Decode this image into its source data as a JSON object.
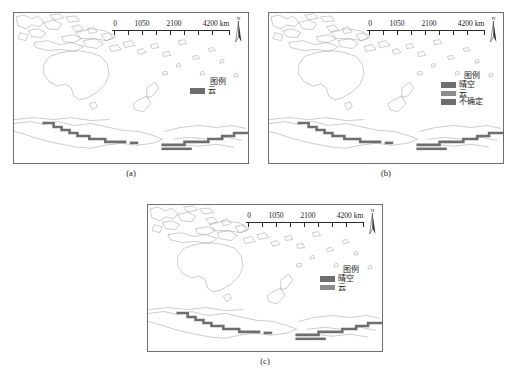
{
  "figure": {
    "background": "#ffffff",
    "panel_count": 3
  },
  "common": {
    "scalebar": {
      "labels": [
        "0",
        "1050",
        "2100",
        "4200 km"
      ],
      "tick_count": 9
    },
    "north_arrow": {
      "letter": "N",
      "icon": "north-arrow-icon"
    },
    "legend_title": "图例",
    "colors": {
      "cloud": "#6e6e6e",
      "clear_sky": "#6e6e6e",
      "uncertain": "#6e6e6e",
      "cloud_light": "#8c8c8c",
      "frame": "#6f6f6f",
      "coastline": "#8d8d8d",
      "overlay_dark": "#707070"
    }
  },
  "panels": [
    {
      "id": "a",
      "caption": "(a)",
      "legend": {
        "title": "图例",
        "entries": [
          {
            "label": "云",
            "color": "#6e6e6e"
          }
        ]
      }
    },
    {
      "id": "b",
      "caption": "(b)",
      "legend": {
        "title": "图例",
        "entries": [
          {
            "label": "晴空",
            "color": "#6e6e6e"
          },
          {
            "label": "云",
            "color": "#8c8c8c"
          },
          {
            "label": "不确定",
            "color": "#6e6e6e"
          }
        ]
      }
    },
    {
      "id": "c",
      "caption": "(c)",
      "legend": {
        "title": "图例",
        "entries": [
          {
            "label": "晴空",
            "color": "#6e6e6e"
          },
          {
            "label": "云",
            "color": "#8c8c8c"
          }
        ]
      }
    }
  ]
}
